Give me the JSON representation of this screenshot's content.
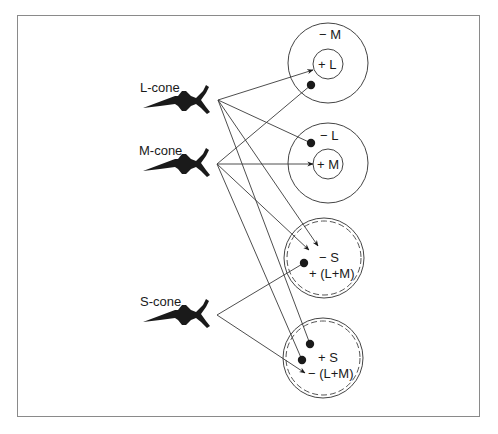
{
  "figure": {
    "frame_color": "#8a8a8a",
    "ink_color": "#1a1a1a",
    "line_color": "#3a3a3a"
  },
  "cones": [
    {
      "id": "L",
      "label": "L-cone",
      "origin": [
        218,
        100
      ],
      "label_pos": [
        140,
        80
      ],
      "body_y": 100
    },
    {
      "id": "M",
      "label": "M-cone",
      "origin": [
        217,
        164
      ],
      "label_pos": [
        139,
        143
      ],
      "body_y": 163
    },
    {
      "id": "S",
      "label": "S-cone",
      "origin": [
        217,
        315
      ],
      "label_pos": [
        140,
        294
      ],
      "body_y": 314
    }
  ],
  "cells": [
    {
      "id": "cell-1",
      "type": "single-opponent",
      "center": [
        328,
        63
      ],
      "outer_r": 40,
      "inner_r": 15,
      "surround_label": "− M",
      "center_label": "+ L",
      "dashed": false
    },
    {
      "id": "cell-2",
      "type": "single-opponent",
      "center": [
        328,
        163
      ],
      "outer_r": 40,
      "inner_r": 15,
      "surround_label": "− L",
      "center_label": "+ M",
      "dashed": false
    },
    {
      "id": "cell-3",
      "type": "coextensive",
      "center": [
        324,
        258
      ],
      "outer_r": 40,
      "labels": [
        "− S",
        "+ (L+M)"
      ],
      "dashed": true
    },
    {
      "id": "cell-4",
      "type": "coextensive",
      "center": [
        323,
        358
      ],
      "outer_r": 40,
      "labels": [
        "+ S",
        "− (L+M)"
      ],
      "dashed": true
    }
  ],
  "connections": [
    {
      "from": "L",
      "to": "cell-1",
      "end": [
        313,
        70
      ],
      "kind": "excitatory-arrow"
    },
    {
      "from": "L",
      "to": "cell-2",
      "end": [
        311,
        143
      ],
      "kind": "inhibitory-dot"
    },
    {
      "from": "L",
      "to": "cell-3",
      "end": [
        318,
        246
      ],
      "kind": "excitatory-arrow"
    },
    {
      "from": "L",
      "to": "cell-4",
      "end": [
        310,
        344
      ],
      "kind": "inhibitory-dot"
    },
    {
      "from": "M",
      "to": "cell-1",
      "end": [
        311,
        85
      ],
      "kind": "inhibitory-dot"
    },
    {
      "from": "M",
      "to": "cell-2",
      "end": [
        313,
        164
      ],
      "kind": "excitatory-arrow"
    },
    {
      "from": "M",
      "to": "cell-3",
      "end": [
        309,
        250
      ],
      "kind": "excitatory-arrow"
    },
    {
      "from": "M",
      "to": "cell-4",
      "end": [
        302,
        360
      ],
      "kind": "inhibitory-dot"
    },
    {
      "from": "S",
      "to": "cell-3",
      "end": [
        304,
        263
      ],
      "kind": "inhibitory-dot"
    },
    {
      "from": "S",
      "to": "cell-4",
      "end": [
        305,
        373
      ],
      "kind": "excitatory-arrow"
    }
  ]
}
